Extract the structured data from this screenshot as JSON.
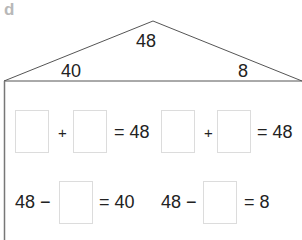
{
  "label": "d",
  "roof": {
    "whole": "48",
    "part_left": "40",
    "part_right": "8"
  },
  "row1": [
    {
      "op": "+",
      "result": "= 48"
    },
    {
      "op": "+",
      "result": "= 48"
    }
  ],
  "row2": [
    {
      "start": "48 −",
      "result": "= 40"
    },
    {
      "start": "48 −",
      "result": "= 8"
    }
  ]
}
